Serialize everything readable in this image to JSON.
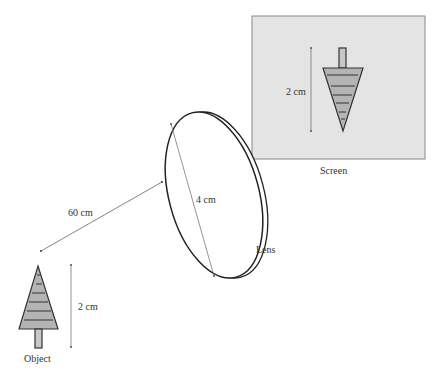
{
  "diagram": {
    "object": {
      "label": "Object",
      "height_label": "2 cm"
    },
    "distance": {
      "label": "60 cm"
    },
    "lens": {
      "label": "Lens",
      "diameter_label": "4 cm"
    },
    "screen": {
      "label": "Screen",
      "height_label": "2 cm",
      "fill_color": "#e4e4e4"
    },
    "tree_fill_color": "#b4b4b4"
  }
}
